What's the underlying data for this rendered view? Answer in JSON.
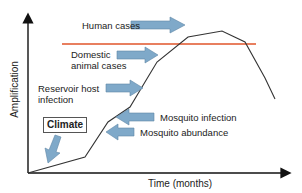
{
  "diagram": {
    "axes": {
      "y_label": "Amplification",
      "x_label": "Time (months)"
    },
    "threshold_line_color": "#e0542a",
    "arrow_color": "#7fa9c9",
    "curve_color": "#333333",
    "labels": {
      "human_cases": "Human cases",
      "domestic_line1": "Domestic",
      "domestic_line2": "animal cases",
      "reservoir_line1": "Reservoir host",
      "reservoir_line2": "infection",
      "mosquito_infection": "Mosquito infection",
      "mosquito_abundance": "Mosquito abundance",
      "climate": "Climate"
    }
  }
}
